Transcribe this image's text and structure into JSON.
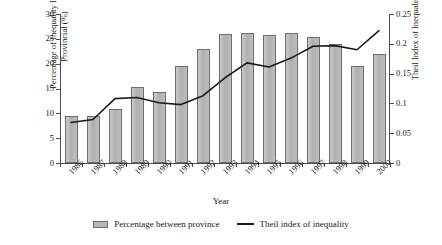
{
  "chart_data": {
    "type": "bar",
    "title": "",
    "xlabel": "Year",
    "ylabel": "Percentage of Inequality Inter-Provincial (%)",
    "ylabel_right": "Theil Index of Inequality",
    "categories": [
      "1986",
      "1987",
      "1988",
      "1989",
      "1990",
      "1991",
      "1992",
      "1993",
      "1994",
      "1995",
      "1996",
      "1997",
      "1998",
      "1999",
      "2000"
    ],
    "ylim": [
      0,
      30
    ],
    "ylim_right": [
      0,
      0.25
    ],
    "yticks": [
      "0",
      "5",
      "10",
      "15",
      "20",
      "25",
      "30"
    ],
    "yticks_right": [
      "0",
      "0.05",
      "0.1",
      "0.15",
      "0.2",
      "0.25"
    ],
    "grid": false,
    "legend_position": "bottom",
    "series": [
      {
        "name": "Percentage between province",
        "type": "bar",
        "axis": "left",
        "color": "#b4b4b4",
        "values": [
          9.5,
          9.5,
          10.8,
          15.3,
          14.2,
          19.6,
          23.0,
          26.0,
          26.2,
          25.8,
          26.2,
          25.4,
          23.9,
          19.5,
          22.0
        ]
      },
      {
        "name": "Theil index of inequality",
        "type": "line",
        "axis": "right",
        "color": "#1a1a1a",
        "values": [
          0.068,
          0.073,
          0.108,
          0.11,
          0.101,
          0.098,
          0.113,
          0.143,
          0.168,
          0.161,
          0.176,
          0.196,
          0.197,
          0.19,
          0.222
        ]
      }
    ]
  },
  "legend": {
    "bar_label": "Percentage between province",
    "line_label": "Theil index of inequality"
  }
}
